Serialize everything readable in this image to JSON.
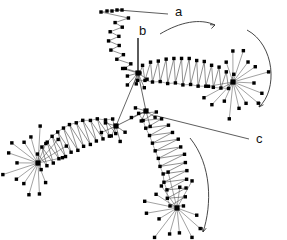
{
  "figure": {
    "background_color": "#ffffff",
    "node_color": "#000000",
    "edge_color": "#555555",
    "annotation_color": "#111111"
  },
  "annotations": [
    {
      "id": "a",
      "label": "a",
      "x": 175,
      "y": 16,
      "leader_from": [
        168,
        14
      ],
      "leader_to": [
        118,
        10
      ]
    },
    {
      "id": "b",
      "label": "b",
      "x": 139,
      "y": 35,
      "leader_from": [
        138,
        38
      ],
      "leader_to": [
        138,
        73
      ]
    },
    {
      "id": "c",
      "label": "c",
      "x": 256,
      "y": 143,
      "leader_from": [
        249,
        139
      ],
      "leader_to": [
        157,
        116
      ]
    }
  ],
  "curved_arrows": [
    {
      "id": "arrow-top",
      "path": "M 160,34 C 180,22 200,18 215,25",
      "direction": "right"
    },
    {
      "id": "arrow-right",
      "path": "M 247,30 C 275,45 278,90 259,107",
      "direction": "down-left"
    },
    {
      "id": "arrow-bottom",
      "path": "M 190,138 C 212,165 212,205 203,232",
      "direction": "down"
    }
  ],
  "hubs": [
    {
      "id": "hub-center",
      "x": 138,
      "y": 73,
      "spokes": 6
    },
    {
      "id": "hub-right",
      "x": 233,
      "y": 82,
      "spokes": 16
    },
    {
      "id": "hub-left",
      "x": 38,
      "y": 163,
      "spokes": 16
    },
    {
      "id": "hub-bottom",
      "x": 177,
      "y": 208,
      "spokes": 14
    },
    {
      "id": "hub-inner-upper",
      "x": 146,
      "y": 111,
      "spokes": 5
    },
    {
      "id": "hub-inner-lower",
      "x": 116,
      "y": 126,
      "spokes": 5
    }
  ],
  "chart_data": {
    "type": "scatter",
    "title": "",
    "xlabel": "",
    "ylabel": "",
    "arms": [
      {
        "name": "arm-top",
        "terminus": "hub-center"
      },
      {
        "name": "arm-right",
        "terminus": "hub-right"
      },
      {
        "name": "arm-left",
        "terminus": "hub-left"
      },
      {
        "name": "arm-bottom",
        "terminus": "hub-bottom"
      }
    ],
    "legend": []
  }
}
